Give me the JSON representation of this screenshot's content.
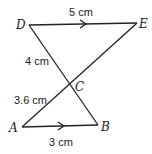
{
  "diagram": {
    "points": {
      "D": {
        "label": "D",
        "x": 29,
        "y": 25
      },
      "E": {
        "label": "E",
        "x": 137,
        "y": 23
      },
      "C": {
        "label": "C",
        "x": 70,
        "y": 85
      },
      "A": {
        "label": "A",
        "x": 22,
        "y": 127
      },
      "B": {
        "label": "B",
        "x": 98,
        "y": 125
      }
    },
    "lengths": {
      "DE": "5 cm",
      "DC": "4 cm",
      "AC": "3.6 cm",
      "AB": "3 cm"
    },
    "line_color": "#222222"
  }
}
